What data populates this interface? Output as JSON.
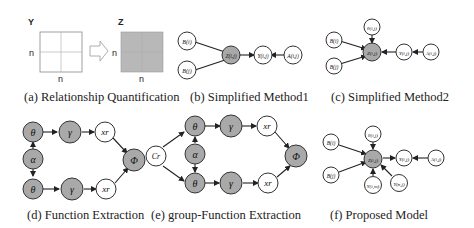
{
  "colors": {
    "shaded": "#a9a9a9",
    "open": "#ffffff",
    "stroke": "#333333",
    "matrix_fill": "#b8b8b8"
  },
  "panels": [
    {
      "id": "a",
      "caption": "(a) Relationship Quantification",
      "matrix_y": {
        "label": "Y",
        "row_label": "n",
        "col_label": "n"
      },
      "matrix_z": {
        "label": "Z",
        "row_label": "n",
        "col_label": "n"
      }
    },
    {
      "id": "b",
      "caption": "(b) Simplified Method1",
      "nodes": {
        "b1": "B(i)",
        "b2": "B(j)",
        "z": "Z(i,j)",
        "y": "Y(i,j)",
        "a": "A(i,j)"
      }
    },
    {
      "id": "c",
      "caption": "(c) Simplified Method2",
      "nodes": {
        "b1": "B(i)",
        "b2": "B(j)",
        "theta": "θ(i,j)",
        "z": "Z(i,j)",
        "y": "Y(i,j)",
        "a": "A(i,j)"
      }
    },
    {
      "id": "d",
      "caption": "(d) Function Extraction",
      "nodes": {
        "theta1": "θ",
        "gamma1": "γ",
        "x1": "xr",
        "alpha": "α",
        "phi": "Φ",
        "theta2": "θ",
        "gamma2": "γ",
        "x2": "xr"
      }
    },
    {
      "id": "e",
      "caption": "(e) group-Function Extraction",
      "nodes": {
        "cr": "Cr",
        "theta1": "θ",
        "gamma1": "γ",
        "x1": "xr",
        "alpha": "α",
        "phi": "Φ",
        "theta2": "θ",
        "gamma2": "γ",
        "x2": "xr"
      }
    },
    {
      "id": "f",
      "caption": "(f) Proposed Model",
      "nodes": {
        "b1": "B(i)",
        "b2": "B(j)",
        "theta": "θ(i,j)",
        "z": "Z(i,j)",
        "y": "Y(i,j)",
        "a": "A(i,j)",
        "yim": "Y(i,m)",
        "ynj": "Y(n,j)"
      }
    }
  ]
}
